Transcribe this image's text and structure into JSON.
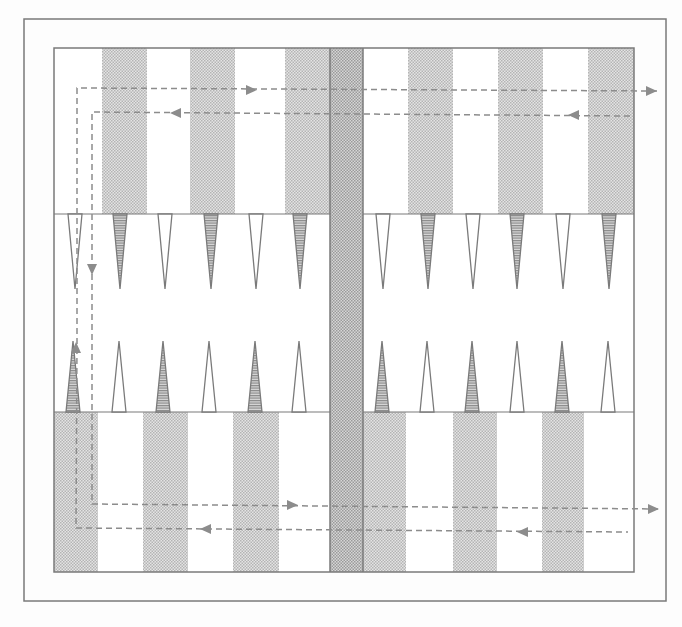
{
  "diagram": {
    "title": "",
    "colors": {
      "background": "#fdfdfd",
      "line": "#7a7a7a",
      "shade_light": "#cfcfcf",
      "shade_dark": "#a8a8a8",
      "triangle_hatch": "#8a8a8a",
      "dash": "#8c8c8c"
    },
    "outer_frame": {
      "x": 24,
      "y": 19,
      "w": 642,
      "h": 582
    },
    "board": {
      "x": 54,
      "y": 48,
      "w": 580,
      "h": 524
    },
    "bar": {
      "x": 330,
      "w": 33
    },
    "sections": {
      "top_y": 48,
      "top_bottom": 214,
      "bottom_top": 412,
      "bottom_y": 572
    },
    "top_stripes": [
      {
        "x": 102,
        "w": 45
      },
      {
        "x": 190,
        "w": 45
      },
      {
        "x": 285,
        "w": 45
      },
      {
        "x": 408,
        "w": 45
      },
      {
        "x": 498,
        "w": 45
      },
      {
        "x": 588,
        "w": 46
      }
    ],
    "bottom_stripes": [
      {
        "x": 54,
        "w": 44
      },
      {
        "x": 143,
        "w": 45
      },
      {
        "x": 233,
        "w": 46
      },
      {
        "x": 363,
        "w": 43
      },
      {
        "x": 453,
        "w": 44
      },
      {
        "x": 542,
        "w": 42
      }
    ],
    "upper_points": [
      {
        "cx": 75,
        "shaded": false
      },
      {
        "cx": 120,
        "shaded": true
      },
      {
        "cx": 165,
        "shaded": false
      },
      {
        "cx": 211,
        "shaded": true
      },
      {
        "cx": 256,
        "shaded": false
      },
      {
        "cx": 300,
        "shaded": true
      },
      {
        "cx": 383,
        "shaded": false
      },
      {
        "cx": 428,
        "shaded": true
      },
      {
        "cx": 473,
        "shaded": false
      },
      {
        "cx": 517,
        "shaded": true
      },
      {
        "cx": 563,
        "shaded": false
      },
      {
        "cx": 609,
        "shaded": true
      }
    ],
    "lower_points": [
      {
        "cx": 73,
        "shaded": true
      },
      {
        "cx": 119,
        "shaded": false
      },
      {
        "cx": 163,
        "shaded": true
      },
      {
        "cx": 209,
        "shaded": false
      },
      {
        "cx": 255,
        "shaded": true
      },
      {
        "cx": 299,
        "shaded": false
      },
      {
        "cx": 382,
        "shaded": true
      },
      {
        "cx": 427,
        "shaded": false
      },
      {
        "cx": 472,
        "shaded": true
      },
      {
        "cx": 517,
        "shaded": false
      },
      {
        "cx": 562,
        "shaded": true
      },
      {
        "cx": 608,
        "shaded": false
      }
    ],
    "point_size": {
      "half_width": 7,
      "upper_apex_y": 289,
      "lower_apex_y": 341
    },
    "paths": [
      {
        "name": "path-outer-loop",
        "points": [
          [
            657,
            91
          ],
          [
            77,
            88
          ],
          [
            77,
            342
          ],
          [
            76,
            528
          ],
          [
            628,
            532
          ]
        ],
        "arrows": [
          {
            "x": 257,
            "y": 90,
            "dir": "right"
          },
          {
            "x": 657,
            "y": 91,
            "dir": "right"
          },
          {
            "x": 76,
            "y": 342,
            "dir": "up"
          },
          {
            "x": 200,
            "y": 529,
            "dir": "left"
          },
          {
            "x": 517,
            "y": 532,
            "dir": "left"
          }
        ]
      },
      {
        "name": "path-inner-loop",
        "points": [
          [
            630,
            116
          ],
          [
            92,
            112
          ],
          [
            92,
            504
          ],
          [
            659,
            509
          ]
        ],
        "arrows": [
          {
            "x": 568,
            "y": 115,
            "dir": "left"
          },
          {
            "x": 170,
            "y": 113,
            "dir": "left"
          },
          {
            "x": 92,
            "y": 275,
            "dir": "down"
          },
          {
            "x": 298,
            "y": 505,
            "dir": "right"
          },
          {
            "x": 659,
            "y": 509,
            "dir": "right"
          }
        ]
      }
    ]
  }
}
